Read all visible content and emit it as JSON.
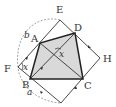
{
  "diagram": {
    "type": "geometry",
    "colors": {
      "stroke": "#333333",
      "fill": "#d9d9d9",
      "dashed": "#999999",
      "background": "#ffffff"
    },
    "points": {
      "A": {
        "label": "A",
        "x": 40,
        "y": 43
      },
      "B": {
        "label": "B",
        "x": 30,
        "y": 79
      },
      "C": {
        "label": "C",
        "x": 83,
        "y": 79
      },
      "D": {
        "label": "D",
        "x": 75,
        "y": 33
      },
      "E": {
        "label": "E",
        "x": 60,
        "y": 20
      },
      "F": {
        "label": "F",
        "x": 18,
        "y": 67
      },
      "G": {
        "label": "G",
        "x": 61,
        "y": 103
      },
      "H": {
        "label": "H",
        "x": 100,
        "y": 58
      },
      "O": {
        "label": "",
        "x": 58,
        "y": 52
      }
    },
    "labels": {
      "A": "A",
      "B": "B",
      "C": "C",
      "D": "D",
      "E": "E",
      "F": "F",
      "H": "H",
      "angle_center": "x",
      "angle_F": "x",
      "side_b": "b",
      "side_a": "a"
    }
  }
}
